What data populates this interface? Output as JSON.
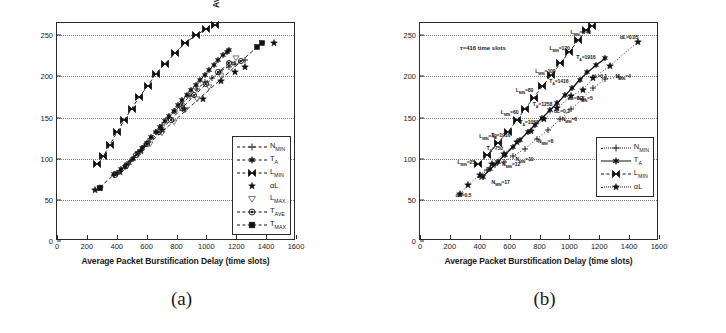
{
  "figure": {
    "caption_a": "(a)",
    "caption_b": "(b)"
  },
  "axes": {
    "xlabel": "Average Packet Burstification Delay (time slots)",
    "ylabel": "Average Burst Size (packets)",
    "xticks": [
      0,
      200,
      400,
      600,
      800,
      1000,
      1200,
      1400,
      1600
    ],
    "yticks": [
      0,
      50,
      100,
      150,
      200,
      250
    ],
    "xlim": [
      0,
      1600
    ],
    "ylim": [
      0,
      265
    ],
    "grid": "dotted-horizontal"
  },
  "panel_a": {
    "legend": {
      "position": "lower-right",
      "items": [
        {
          "label": "N",
          "sub": "MIN",
          "marker": "plus",
          "line": "dashed"
        },
        {
          "label": "T",
          "sub": "A",
          "marker": "hexagram",
          "line": "dashed"
        },
        {
          "label": "L",
          "sub": "MIN",
          "marker": "bowtie",
          "line": "dashed"
        },
        {
          "label": "αL",
          "sub": "",
          "marker": "star",
          "line": "none"
        },
        {
          "label": "L",
          "sub": "MAX",
          "marker": "triangle-down",
          "line": "none"
        },
        {
          "label": "T",
          "sub": "AVE",
          "marker": "circle-dot",
          "line": "dashed"
        },
        {
          "label": "T",
          "sub": "MAX",
          "marker": "square",
          "line": "dashed"
        }
      ]
    }
  },
  "panel_b": {
    "note": "τ=416 time slots",
    "legend": {
      "position": "lower-right",
      "items": [
        {
          "label": "N",
          "sub": "MIN",
          "marker": "plus",
          "line": "dotted"
        },
        {
          "label": "T",
          "sub": "A",
          "marker": "hexagram",
          "line": "solid"
        },
        {
          "label": "L",
          "sub": "MIN",
          "marker": "bowtie",
          "line": "dashed"
        },
        {
          "label": "αL",
          "sub": "",
          "marker": "star",
          "line": "dotted"
        }
      ]
    },
    "annotations": [
      {
        "text": "L",
        "sub": "MIN",
        "value": "=140",
        "x": 1075,
        "y": 253
      },
      {
        "text": "L",
        "sub": "MIN",
        "value": "=120",
        "x": 935,
        "y": 234
      },
      {
        "text": "L",
        "sub": "MIN",
        "value": "=100",
        "x": 840,
        "y": 206
      },
      {
        "text": "L",
        "sub": "MIN",
        "value": "=80",
        "x": 700,
        "y": 182
      },
      {
        "text": "L",
        "sub": "MIN",
        "value": "=60",
        "x": 600,
        "y": 155
      },
      {
        "text": "L",
        "sub": "MIN",
        "value": "=40",
        "x": 455,
        "y": 127
      },
      {
        "text": "L",
        "sub": "MIN",
        "value": "=25",
        "x": 310,
        "y": 95
      },
      {
        "text": "T",
        "sub": "A",
        "value": "=1916",
        "x": 1110,
        "y": 222
      },
      {
        "text": "T",
        "sub": "A",
        "value": "=1416",
        "x": 930,
        "y": 193
      },
      {
        "text": "T",
        "sub": "A",
        "value": "=1258",
        "x": 820,
        "y": 165
      },
      {
        "text": "T",
        "sub": "A",
        "value": "=1058",
        "x": 730,
        "y": 143
      },
      {
        "text": "T",
        "sub": "A",
        "value": "=1916",
        "x": 540,
        "y": 128
      },
      {
        "text": "T",
        "sub": "A",
        "value": "=750",
        "x": 500,
        "y": 112
      },
      {
        "text": "N",
        "sub": "MIN",
        "value": "=4",
        "x": 1360,
        "y": 199
      },
      {
        "text": "N",
        "sub": "MIN",
        "value": "=5",
        "x": 1105,
        "y": 173
      },
      {
        "text": "N",
        "sub": "MIN",
        "value": "=6",
        "x": 1000,
        "y": 147
      },
      {
        "text": "N",
        "sub": "MIN",
        "value": "=8",
        "x": 840,
        "y": 120
      },
      {
        "text": "N",
        "sub": "MIN",
        "value": "=10",
        "x": 700,
        "y": 98
      },
      {
        "text": "N",
        "sub": "MIN",
        "value": "=12",
        "x": 610,
        "y": 92
      },
      {
        "text": "N",
        "sub": "MIN",
        "value": "=17",
        "x": 540,
        "y": 70
      },
      {
        "text": "αL",
        "sub": "",
        "value": "=0.05",
        "x": 1400,
        "y": 248
      },
      {
        "text": "αL",
        "sub": "",
        "value": "=0.1",
        "x": 1200,
        "y": 200
      },
      {
        "text": "αL",
        "sub": "",
        "value": "=0.2",
        "x": 1040,
        "y": 174
      },
      {
        "text": "αL",
        "sub": "",
        "value": "=0.3",
        "x": 950,
        "y": 158
      },
      {
        "text": "αL",
        "sub": "",
        "value": "=0.5",
        "x": 290,
        "y": 56
      }
    ]
  },
  "chart_data": {
    "type": "scatter",
    "title": "",
    "xlabel": "Average Packet Burstification Delay (time slots)",
    "ylabel": "Average Burst Size (packets)",
    "xlim": [
      0,
      1600
    ],
    "ylim": [
      0,
      265
    ],
    "panels": [
      {
        "name": "(a)",
        "series": [
          {
            "name": "N_MIN",
            "marker": "plus",
            "line": "dashed",
            "points": [
              [
                380,
                80
              ],
              [
                420,
                85
              ],
              [
                460,
                92
              ],
              [
                500,
                100
              ],
              [
                540,
                108
              ],
              [
                580,
                116
              ],
              [
                620,
                124
              ],
              [
                660,
                133
              ],
              [
                700,
                141
              ],
              [
                740,
                149
              ],
              [
                790,
                158
              ],
              [
                840,
                167
              ],
              [
                890,
                176
              ],
              [
                940,
                185
              ],
              [
                990,
                193
              ],
              [
                1040,
                198
              ],
              [
                1090,
                206
              ],
              [
                1150,
                212
              ],
              [
                1190,
                215
              ],
              [
                1260,
                220
              ]
            ]
          },
          {
            "name": "T_A",
            "marker": "hexagram",
            "line": "dashed",
            "points": [
              [
                380,
                81
              ],
              [
                405,
                83
              ],
              [
                430,
                87
              ],
              [
                455,
                90
              ],
              [
                480,
                95
              ],
              [
                510,
                100
              ],
              [
                540,
                107
              ],
              [
                570,
                113
              ],
              [
                600,
                119
              ],
              [
                630,
                126
              ],
              [
                660,
                132
              ],
              [
                690,
                139
              ],
              [
                720,
                146
              ],
              [
                750,
                152
              ],
              [
                780,
                158
              ],
              [
                810,
                165
              ],
              [
                840,
                171
              ],
              [
                870,
                178
              ],
              [
                900,
                184
              ],
              [
                930,
                190
              ],
              [
                960,
                196
              ],
              [
                990,
                202
              ],
              [
                1020,
                208
              ],
              [
                1050,
                214
              ],
              [
                1080,
                220
              ],
              [
                1110,
                226
              ],
              [
                1140,
                230
              ],
              [
                1150,
                232
              ]
            ]
          },
          {
            "name": "L_MIN",
            "marker": "bowtie",
            "line": "dashed",
            "points": [
              [
                265,
                93
              ],
              [
                310,
                103
              ],
              [
                355,
                117
              ],
              [
                400,
                132
              ],
              [
                450,
                147
              ],
              [
                500,
                161
              ],
              [
                550,
                175
              ],
              [
                610,
                189
              ],
              [
                660,
                203
              ],
              [
                720,
                215
              ],
              [
                790,
                228
              ],
              [
                860,
                241
              ],
              [
                930,
                250
              ],
              [
                1000,
                258
              ],
              [
                1060,
                262
              ]
            ]
          },
          {
            "name": "aL",
            "marker": "star",
            "line": "none",
            "points": [
              [
                255,
                62
              ],
              [
                290,
                65
              ],
              [
                420,
                84
              ],
              [
                560,
                110
              ],
              [
                700,
                135
              ],
              [
                850,
                160
              ],
              [
                980,
                173
              ],
              [
                1100,
                194
              ],
              [
                1190,
                205
              ],
              [
                1260,
                212
              ],
              [
                1450,
                241
              ]
            ]
          },
          {
            "name": "L_MAX",
            "marker": "triangle-down",
            "line": "none",
            "points": [
              [
                400,
                82
              ],
              [
                470,
                92
              ],
              [
                540,
                104
              ],
              [
                620,
                118
              ],
              [
                700,
                131
              ],
              [
                780,
                145
              ],
              [
                860,
                159
              ],
              [
                940,
                173
              ],
              [
                1020,
                187
              ],
              [
                1100,
                200
              ],
              [
                1160,
                215
              ],
              [
                1200,
                222
              ]
            ]
          },
          {
            "name": "T_AVE",
            "marker": "circle-dot",
            "line": "dashed",
            "points": [
              [
                390,
                80
              ],
              [
                460,
                91
              ],
              [
                530,
                104
              ],
              [
                600,
                118
              ],
              [
                680,
                132
              ],
              [
                760,
                147
              ],
              [
                840,
                162
              ],
              [
                920,
                177
              ],
              [
                1000,
                191
              ],
              [
                1080,
                205
              ],
              [
                1150,
                216
              ],
              [
                1230,
                219
              ]
            ]
          },
          {
            "name": "T_MAX",
            "marker": "square",
            "line": "dashed",
            "points": [
              [
                285,
                65
              ],
              [
                1340,
                236
              ],
              [
                1375,
                241
              ]
            ]
          }
        ]
      },
      {
        "name": "(b)",
        "series": [
          {
            "name": "N_MIN",
            "marker": "plus",
            "line": "dotted",
            "points": [
              [
                400,
                78
              ],
              [
                450,
                86
              ],
              [
                500,
                92
              ],
              [
                560,
                96
              ],
              [
                620,
                103
              ],
              [
                700,
                112
              ],
              [
                780,
                124
              ],
              [
                860,
                135
              ],
              [
                940,
                148
              ],
              [
                1010,
                160
              ],
              [
                1090,
                173
              ],
              [
                1160,
                186
              ],
              [
                1240,
                197
              ],
              [
                1330,
                199
              ]
            ]
          },
          {
            "name": "T_A",
            "marker": "hexagram",
            "line": "solid",
            "points": [
              [
                420,
                78
              ],
              [
                470,
                87
              ],
              [
                520,
                96
              ],
              [
                570,
                105
              ],
              [
                620,
                114
              ],
              [
                670,
                123
              ],
              [
                720,
                132
              ],
              [
                770,
                141
              ],
              [
                820,
                150
              ],
              [
                870,
                159
              ],
              [
                920,
                168
              ],
              [
                970,
                177
              ],
              [
                1020,
                186
              ],
              [
                1070,
                196
              ],
              [
                1120,
                205
              ],
              [
                1180,
                214
              ],
              [
                1240,
                222
              ]
            ]
          },
          {
            "name": "L_MIN",
            "marker": "bowtie",
            "line": "dashed",
            "points": [
              [
                390,
                93
              ],
              [
                450,
                104
              ],
              [
                520,
                119
              ],
              [
                590,
                133
              ],
              [
                650,
                147
              ],
              [
                700,
                160
              ],
              [
                760,
                174
              ],
              [
                820,
                188
              ],
              [
                880,
                202
              ],
              [
                940,
                216
              ],
              [
                1000,
                230
              ],
              [
                1060,
                244
              ],
              [
                1110,
                256
              ],
              [
                1150,
                261
              ]
            ]
          },
          {
            "name": "aL",
            "marker": "star",
            "line": "dotted",
            "points": [
              [
                270,
                57
              ],
              [
                320,
                68
              ],
              [
                400,
                80
              ],
              [
                480,
                93
              ],
              [
                560,
                106
              ],
              [
                650,
                120
              ],
              [
                740,
                134
              ],
              [
                830,
                148
              ],
              [
                920,
                162
              ],
              [
                1010,
                176
              ],
              [
                1090,
                184
              ],
              [
                1160,
                198
              ],
              [
                1270,
                213
              ],
              [
                1460,
                242
              ]
            ]
          }
        ]
      }
    ]
  }
}
